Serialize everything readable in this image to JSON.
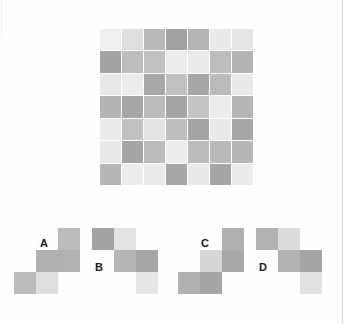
{
  "palette": {
    "very_light": "#eeeeee",
    "light": "#e4e4e4",
    "light_medium": "#d8d8d8",
    "medium_light": "#cfcfcf",
    "medium": "#b8b8b8",
    "medium_dark": "#a9a9a9",
    "dark": "#9b9b9b",
    "background": "#fefefe",
    "border": "#d8d8d8",
    "label_text": "#1a1a1a"
  },
  "main_grid": {
    "name": "pattern-grid",
    "rows": 7,
    "cols": 7,
    "cells": [
      [
        "#eeeeee",
        "#dedede",
        "#b9b9b9",
        "#a2a2a2",
        "#b5b5b5",
        "#e9e9e9",
        "#e6e6e6"
      ],
      [
        "#a3a3a3",
        "#bdbdbd",
        "#bfbfbf",
        "#ececec",
        "#ebebeb",
        "#bdbdbd",
        "#b4b4b4"
      ],
      [
        "#e8e8e8",
        "#ececec",
        "#a8a8a8",
        "#c0c0c0",
        "#a6a6a6",
        "#bbbbbb",
        "#e9e9e9"
      ],
      [
        "#b4b4b4",
        "#a6a6a6",
        "#bcbcbc",
        "#a5a5a5",
        "#c3c3c3",
        "#ececec",
        "#b6b6b6"
      ],
      [
        "#eaeaea",
        "#c0c0c0",
        "#e3e3e3",
        "#bebebe",
        "#a4a4a4",
        "#e9e9e9",
        "#a6a6a6"
      ],
      [
        "#e9e9e9",
        "#a5a5a5",
        "#bbbbbb",
        "#ededed",
        "#bcbcbc",
        "#bababa",
        "#b7b7b7"
      ],
      [
        "#b7b7b7",
        "#ececec",
        "#ebebeb",
        "#a6a6a6",
        "#e9e9e9",
        "#a5a5a5",
        "#ebebeb"
      ]
    ]
  },
  "options": [
    {
      "id": "A",
      "label": "A",
      "label_pos": {
        "left": 26,
        "top": 10
      },
      "cells": [
        {
          "x": 44,
          "y": 0,
          "color": "#bcbcbc"
        },
        {
          "x": 22,
          "y": 22,
          "color": "#b0b0b0"
        },
        {
          "x": 44,
          "y": 22,
          "color": "#b2b2b2"
        },
        {
          "x": 0,
          "y": 44,
          "color": "#bbbbbb"
        },
        {
          "x": 22,
          "y": 44,
          "color": "#dddddd"
        }
      ]
    },
    {
      "id": "B",
      "label": "B",
      "label_pos": {
        "left": 3,
        "top": 34
      },
      "cells": [
        {
          "x": 0,
          "y": 0,
          "color": "#a3a3a3"
        },
        {
          "x": 22,
          "y": 0,
          "color": "#e3e3e3"
        },
        {
          "x": 22,
          "y": 22,
          "color": "#b5b5b5"
        },
        {
          "x": 44,
          "y": 22,
          "color": "#a6a6a6"
        },
        {
          "x": 44,
          "y": 44,
          "color": "#e6e6e6"
        }
      ]
    },
    {
      "id": "C",
      "label": "C",
      "label_pos": {
        "left": 23,
        "top": 10
      },
      "cells": [
        {
          "x": 44,
          "y": 0,
          "color": "#b0b0b0"
        },
        {
          "x": 22,
          "y": 22,
          "color": "#d6d6d6"
        },
        {
          "x": 44,
          "y": 22,
          "color": "#a8a8a8"
        },
        {
          "x": 0,
          "y": 44,
          "color": "#b0b0b0"
        },
        {
          "x": 22,
          "y": 44,
          "color": "#a5a5a5"
        }
      ]
    },
    {
      "id": "D",
      "label": "D",
      "label_pos": {
        "left": 3,
        "top": 34
      },
      "cells": [
        {
          "x": 0,
          "y": 0,
          "color": "#b2b2b2"
        },
        {
          "x": 22,
          "y": 0,
          "color": "#dcdcdc"
        },
        {
          "x": 22,
          "y": 22,
          "color": "#b3b3b3"
        },
        {
          "x": 44,
          "y": 22,
          "color": "#a5a5a5"
        },
        {
          "x": 44,
          "y": 44,
          "color": "#e2e2e2"
        }
      ]
    }
  ]
}
